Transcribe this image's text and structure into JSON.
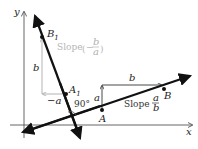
{
  "axes": {
    "x_label": "x",
    "y_label": "y"
  },
  "line_slope": {
    "point_a": "A",
    "point_b": "B",
    "rise_label": "a",
    "run_label": "b",
    "slope_word": "Slope",
    "slope_num": "a",
    "slope_den": "b"
  },
  "line_perpendicular": {
    "point_a1": "A",
    "point_a1_sub": "1",
    "point_b1": "B",
    "point_b1_sub": "1",
    "rise_label": "b",
    "run_label": "−a",
    "slope_word": "Slope",
    "slope_sign": "−",
    "slope_num": "b",
    "slope_den": "a"
  },
  "angle_label": "90°",
  "colors": {
    "main_line": "#111111",
    "axis": "#555555",
    "gray_aux": "#b5b5b5"
  }
}
